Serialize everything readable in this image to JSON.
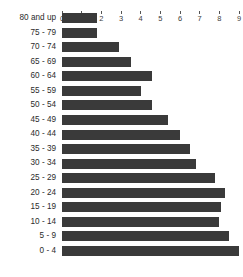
{
  "chart_data": {
    "type": "bar",
    "orientation": "horizontal",
    "title": "",
    "xlabel": "",
    "ylabel": "",
    "xlim": [
      0,
      9
    ],
    "ylim": null,
    "grid": false,
    "legend": null,
    "axis_position": "top",
    "bar_color": "#3a3a3a",
    "background_color": "#ffffff",
    "xticks": [
      "0",
      "1",
      "2",
      "3",
      "4",
      "5",
      "6",
      "7",
      "8",
      "9"
    ],
    "categories": [
      "80 and up",
      "75 - 79",
      "70 - 74",
      "65 - 69",
      "60 - 64",
      "55 - 59",
      "50 - 54",
      "45 - 49",
      "40 - 44",
      "35 - 39",
      "30 - 34",
      "25 - 29",
      "20 - 24",
      "15 - 19",
      "10 - 14",
      "5 - 9",
      "0 - 4"
    ],
    "values": [
      1.8,
      1.8,
      2.9,
      3.5,
      4.6,
      4.0,
      4.6,
      5.4,
      6.0,
      6.5,
      6.8,
      7.8,
      8.3,
      8.1,
      8.0,
      8.5,
      9.0
    ]
  },
  "caption": {
    "text": ""
  }
}
